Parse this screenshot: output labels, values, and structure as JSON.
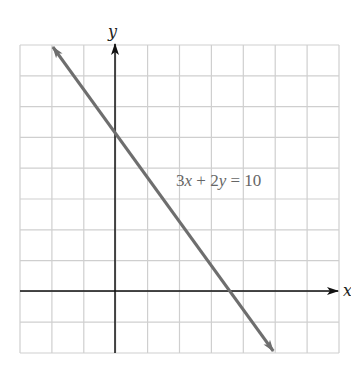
{
  "chart_data": {
    "type": "line",
    "title": "",
    "equation": "3x + 2y = 10",
    "xlabel": "x",
    "ylabel": "y",
    "xlim": [
      -3,
      7
    ],
    "ylim": [
      -2,
      8
    ],
    "grid": true,
    "tick_labels": false,
    "series": [
      {
        "name": "3x + 2y = 10",
        "slope": -1.5,
        "y_intercept": 5,
        "x_intercept": 3.333,
        "points": [
          [
            -2,
            8
          ],
          [
            0,
            5
          ],
          [
            3.333,
            0
          ],
          [
            5,
            -2
          ]
        ],
        "arrows": "both",
        "color": "#6e6e6e"
      }
    ]
  },
  "labels": {
    "x_axis": "x",
    "y_axis": "y",
    "equation_parts": {
      "a": "3",
      "x": "x",
      "plus": " + 2",
      "y": "y",
      "rhs": " = 10"
    }
  },
  "colors": {
    "grid": "#cfcfcf",
    "axes": "#111111",
    "line": "#6e6e6e",
    "equation_text": "#666666"
  }
}
